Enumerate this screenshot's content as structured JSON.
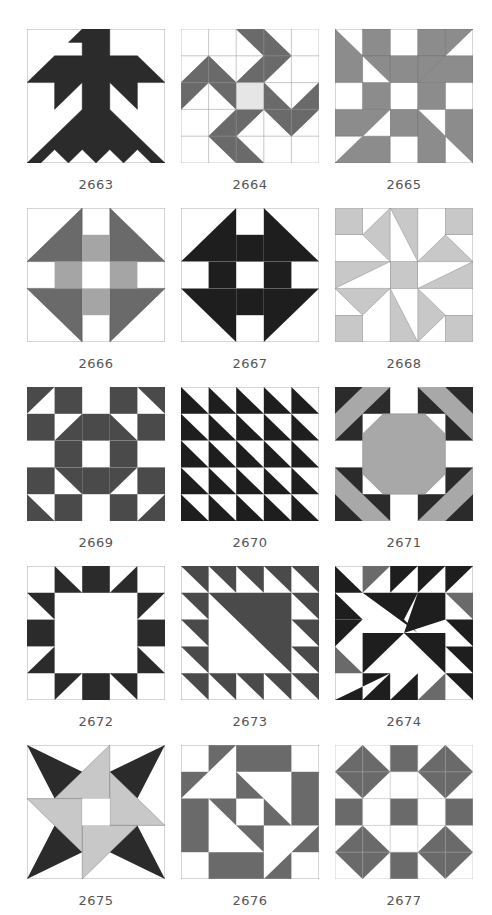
{
  "colors": {
    "dark": "#2b2b2b",
    "medium": "#6a6a6a",
    "gray": "#8c8c8c",
    "light": "#c8c8c8",
    "pale": "#e6e6e6",
    "white": "#ffffff",
    "outline": "#9a9a9a"
  },
  "blocks": [
    {
      "number": "2663"
    },
    {
      "number": "2664"
    },
    {
      "number": "2665"
    },
    {
      "number": "2666"
    },
    {
      "number": "2667"
    },
    {
      "number": "2668"
    },
    {
      "number": "2669"
    },
    {
      "number": "2670"
    },
    {
      "number": "2671"
    },
    {
      "number": "2672"
    },
    {
      "number": "2673"
    },
    {
      "number": "2674"
    },
    {
      "number": "2675"
    },
    {
      "number": "2676"
    },
    {
      "number": "2677"
    }
  ]
}
